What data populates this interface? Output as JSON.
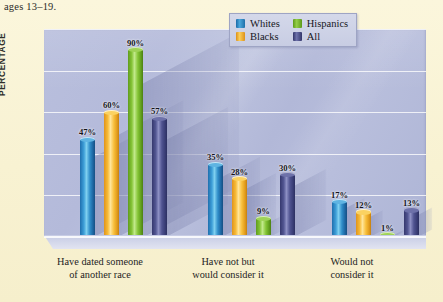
{
  "caption": "ages 13–19.",
  "axis": {
    "ylabel": "PERCENTAGE",
    "yticks": [
      "100",
      "80",
      "60",
      "40",
      "20",
      "0"
    ]
  },
  "legend": [
    {
      "label": "Whites",
      "key": "whites",
      "color": "#2080c8"
    },
    {
      "label": "Hispanics",
      "key": "hispanics",
      "color": "#7cc02e"
    },
    {
      "label": "Blacks",
      "key": "blacks",
      "color": "#f5b225"
    },
    {
      "label": "All",
      "key": "all",
      "color": "#4a4e8e"
    }
  ],
  "categories": [
    {
      "line1": "Have dated someone",
      "line2": "of another race"
    },
    {
      "line1": "Have not but",
      "line2": "would consider it"
    },
    {
      "line1": "Would not",
      "line2": "consider it"
    }
  ],
  "labels": {
    "g0": [
      "47%",
      "60%",
      "90%",
      "57%"
    ],
    "g1": [
      "35%",
      "28%",
      "9%",
      "30%"
    ],
    "g2": [
      "17%",
      "12%",
      "1%",
      "13%"
    ]
  },
  "chart_data": {
    "type": "bar",
    "title": "",
    "subtitle": "ages 13–19.",
    "xlabel": "",
    "ylabel": "PERCENTAGE",
    "ylim": [
      0,
      100
    ],
    "yticks": [
      0,
      20,
      40,
      60,
      80,
      100
    ],
    "grid": true,
    "legend_position": "top-right",
    "value_suffix": "%",
    "categories": [
      "Have dated someone of another race",
      "Have not but would consider it",
      "Would not consider it"
    ],
    "series": [
      {
        "name": "Whites",
        "color": "#2080c8",
        "values": [
          47,
          35,
          17
        ]
      },
      {
        "name": "Blacks",
        "color": "#f5b225",
        "values": [
          60,
          28,
          12
        ]
      },
      {
        "name": "Hispanics",
        "color": "#7cc02e",
        "values": [
          90,
          9,
          1
        ]
      },
      {
        "name": "All",
        "color": "#4a4e8e",
        "values": [
          57,
          30,
          13
        ]
      }
    ]
  }
}
